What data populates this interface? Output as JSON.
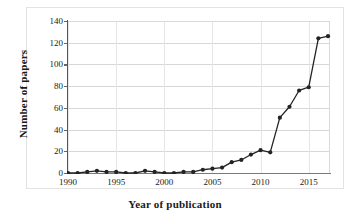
{
  "chart_data": {
    "type": "line",
    "title": "",
    "xlabel": "Year of publication",
    "ylabel": "Number of papers",
    "x": [
      1990,
      1991,
      1992,
      1993,
      1994,
      1995,
      1996,
      1997,
      1998,
      1999,
      2000,
      2001,
      2002,
      2003,
      2004,
      2005,
      2006,
      2007,
      2008,
      2009,
      2010,
      2011,
      2012,
      2013,
      2014,
      2015,
      2016,
      2017
    ],
    "values": [
      0,
      0,
      1,
      2,
      1,
      1,
      0,
      0,
      2,
      1,
      0,
      0,
      1,
      1,
      3,
      4,
      5,
      10,
      12,
      17,
      21,
      19,
      51,
      61,
      76,
      79,
      124,
      126
    ],
    "ylim": [
      0,
      140
    ],
    "xlim": [
      1990,
      2017
    ],
    "yticks": [
      0,
      20,
      40,
      60,
      80,
      100,
      120,
      140
    ],
    "xticks": [
      1990,
      1995,
      2000,
      2005,
      2010,
      2015
    ],
    "grid": true,
    "legend": false,
    "marker": "circle",
    "line_color": "#232323",
    "marker_color": "#232323",
    "grid_color": "#d7d7d7",
    "background": "#ffffff"
  },
  "axes": {
    "ylabel": "Number of papers",
    "xlabel": "Year of publication",
    "ytick_labels": [
      "140",
      "120",
      "100",
      "80",
      "60",
      "40",
      "20",
      "0"
    ],
    "xtick_labels": [
      "1990",
      "1995",
      "2000",
      "2005",
      "2010",
      "2015"
    ]
  }
}
